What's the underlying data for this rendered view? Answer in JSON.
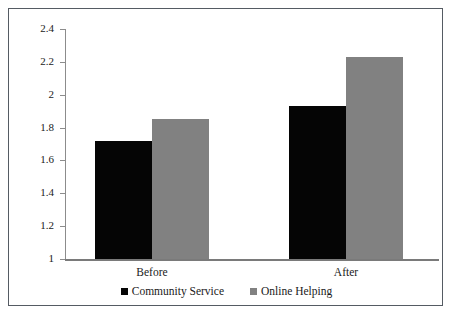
{
  "chart_data": {
    "type": "bar",
    "title": "",
    "subtitle": "",
    "xlabel": "",
    "ylabel": "",
    "categories": [
      "Before",
      "After"
    ],
    "series": [
      {
        "name": "Community Service",
        "color": "#050505",
        "values": [
          1.72,
          1.93
        ]
      },
      {
        "name": "Online Helping",
        "color": "#818181",
        "values": [
          1.85,
          2.23
        ]
      }
    ],
    "ylim": [
      1,
      2.4
    ],
    "y_ticks": [
      {
        "value": 2.4,
        "label": "2.4"
      },
      {
        "value": 2.2,
        "label": "2.2"
      },
      {
        "value": 2.0,
        "label": "2"
      },
      {
        "value": 1.8,
        "label": "1.8"
      },
      {
        "value": 1.6,
        "label": "1.6"
      },
      {
        "value": 1.4,
        "label": "1.4"
      },
      {
        "value": 1.2,
        "label": "1.2"
      },
      {
        "value": 1.0,
        "label": "1"
      }
    ],
    "grid": false,
    "legend_position": "bottom",
    "legend": [
      {
        "label": "Community Service",
        "color": "#050505"
      },
      {
        "label": "Online Helping",
        "color": "#818181"
      }
    ],
    "annotations": [],
    "border": true
  },
  "axis": {
    "x_tick_labels": [
      "Before",
      "After"
    ],
    "y_tick_labels": [
      "2.4",
      "2.2",
      "2",
      "1.8",
      "1.6",
      "1.4",
      "1.2",
      "1"
    ]
  },
  "legend": {
    "entries": [
      {
        "label": "Community Service"
      },
      {
        "label": "Online Helping"
      }
    ]
  },
  "colors": {
    "community_service": "#050505",
    "online_helping": "#818181",
    "axis": "#8c8c8c",
    "border": "#555b63",
    "text": "#1a1a1a",
    "background": "#ffffff"
  }
}
